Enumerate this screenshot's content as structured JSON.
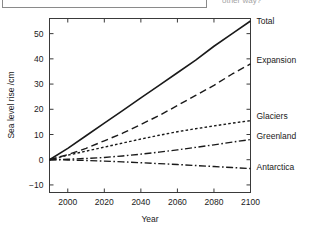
{
  "top_remnant": {
    "input_box_name": "answer-text-box",
    "question_fragment": "other way?"
  },
  "chart_data": {
    "type": "line",
    "title": "",
    "xlabel": "Year",
    "ylabel": "Sea level rise /cm",
    "xlim": [
      1990,
      2100
    ],
    "ylim": [
      -13,
      56
    ],
    "xticks": [
      2000,
      2020,
      2040,
      2060,
      2080,
      2100
    ],
    "xticklabels": [
      "2000",
      "2020",
      "2040",
      "2060",
      "2080",
      "2100"
    ],
    "yticks": [
      -10,
      0,
      10,
      20,
      30,
      40,
      50
    ],
    "yticklabels": [
      "−10",
      "0",
      "10",
      "20",
      "30",
      "40",
      "50"
    ],
    "grid": false,
    "legend_position": "right-of-axes-inline",
    "x": [
      1990,
      2000,
      2010,
      2020,
      2030,
      2040,
      2050,
      2060,
      2070,
      2080,
      2090,
      2100
    ],
    "series": [
      {
        "name": "Total",
        "label": "Total",
        "linestyle": "solid",
        "dasharray": "",
        "color": "#1a1a1a",
        "width": 1.6,
        "label_y_cm": 55,
        "values": [
          0,
          4.5,
          9.5,
          14.5,
          19.5,
          24.5,
          29.5,
          34.5,
          39.5,
          45,
          50,
          55
        ]
      },
      {
        "name": "Expansion",
        "label": "Expansion",
        "linestyle": "long-dash",
        "dasharray": "7,4",
        "color": "#1a1a1a",
        "width": 1.4,
        "label_y_cm": 39.5,
        "values": [
          0,
          2,
          4.5,
          7.5,
          10.5,
          14,
          17.5,
          21.5,
          25.5,
          29.5,
          34,
          38
        ]
      },
      {
        "name": "Glaciers",
        "label": "Glaciers",
        "linestyle": "short-dash",
        "dasharray": "2.6,2.2",
        "color": "#1a1a1a",
        "width": 1.4,
        "label_y_cm": 17.5,
        "values": [
          0,
          1.8,
          3.4,
          5.0,
          6.6,
          8.2,
          9.7,
          11.1,
          12.3,
          13.4,
          14.5,
          15.5
        ]
      },
      {
        "name": "Greenland",
        "label": "Greenland",
        "linestyle": "dash-dot",
        "dasharray": "7,2.5,1.6,2.5",
        "color": "#1a1a1a",
        "width": 1.4,
        "label_y_cm": 9.5,
        "values": [
          0,
          0.2,
          0.5,
          0.9,
          1.5,
          2.2,
          3.0,
          3.9,
          4.9,
          5.9,
          7.0,
          8.0
        ]
      },
      {
        "name": "Antarctica",
        "label": "Antarctica",
        "linestyle": "dash-dot",
        "dasharray": "7,2.5,1.6,2.5",
        "color": "#1a1a1a",
        "width": 1.4,
        "label_y_cm": -3.0,
        "values": [
          0,
          -0.1,
          -0.3,
          -0.55,
          -0.85,
          -1.2,
          -1.55,
          -1.9,
          -2.3,
          -2.7,
          -3.1,
          -3.5
        ]
      }
    ]
  }
}
